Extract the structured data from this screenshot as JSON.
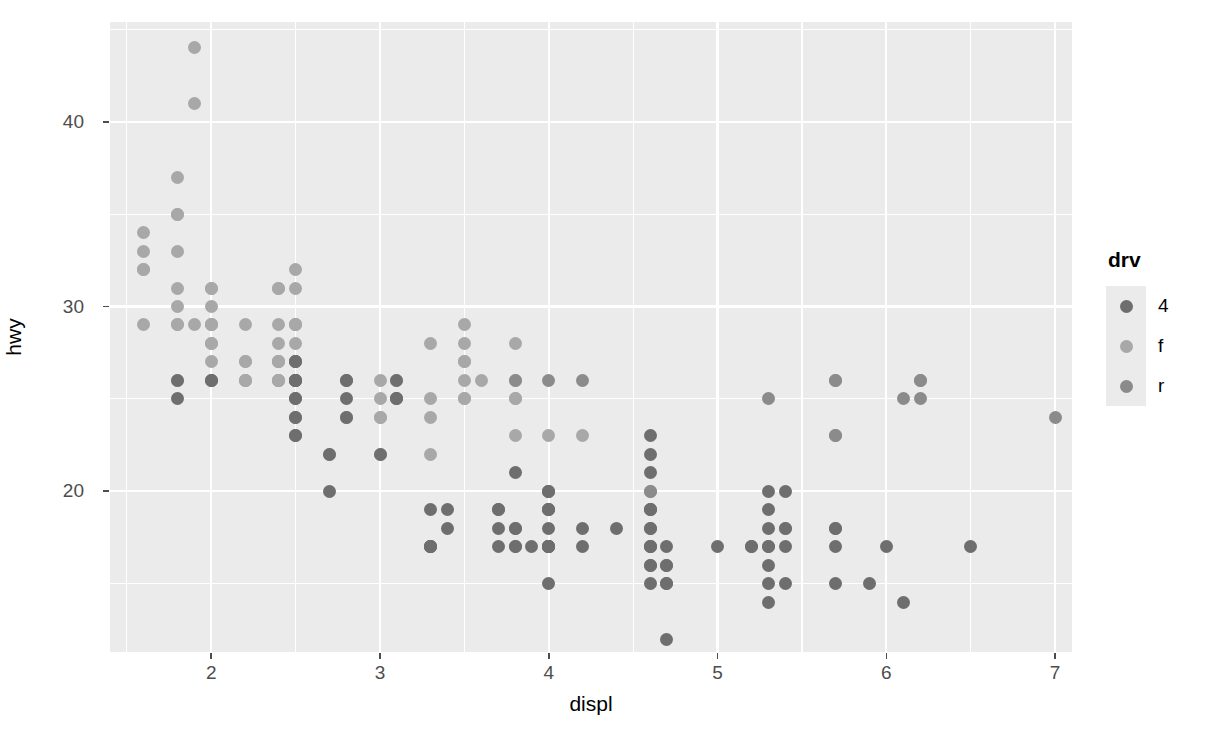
{
  "chart_data": {
    "type": "scatter",
    "title": "",
    "xlabel": "displ",
    "ylabel": "hwy",
    "xlim": [
      1.4,
      7.1
    ],
    "ylim": [
      11.3,
      45.4
    ],
    "xticks": [
      2,
      3,
      4,
      5,
      6,
      7
    ],
    "yticks": [
      20,
      30,
      40
    ],
    "xminor": [
      1.5,
      2.5,
      3.5,
      4.5,
      5.5,
      6.5
    ],
    "yminor": [
      15,
      25,
      35,
      45
    ],
    "grid": true,
    "legend": {
      "title": "drv",
      "position": "right",
      "entries": [
        {
          "label": "4",
          "color": "#6e6e6e"
        },
        {
          "label": "f",
          "color": "#a8a8a8"
        },
        {
          "label": "r",
          "color": "#8b8b8b"
        }
      ]
    },
    "panel_background": "#ebebeb",
    "grid_color": "#ffffff",
    "series": [
      {
        "name": "4",
        "color": "#6e6e6e",
        "points": [
          [
            1.8,
            26
          ],
          [
            1.8,
            25
          ],
          [
            2.0,
            26
          ],
          [
            2.0,
            26
          ],
          [
            2.8,
            26
          ],
          [
            2.8,
            26
          ],
          [
            2.8,
            25
          ],
          [
            2.8,
            24
          ],
          [
            3.1,
            25
          ],
          [
            3.1,
            26
          ],
          [
            3.1,
            25
          ],
          [
            2.5,
            23
          ],
          [
            2.5,
            24
          ],
          [
            2.5,
            24
          ],
          [
            2.5,
            23
          ],
          [
            2.5,
            25
          ],
          [
            2.5,
            26
          ],
          [
            2.5,
            25
          ],
          [
            2.5,
            26
          ],
          [
            2.5,
            26
          ],
          [
            2.5,
            26
          ],
          [
            2.5,
            27
          ],
          [
            2.5,
            27
          ],
          [
            3.3,
            17
          ],
          [
            3.3,
            17
          ],
          [
            3.3,
            17
          ],
          [
            3.3,
            19
          ],
          [
            3.3,
            17
          ],
          [
            3.7,
            17
          ],
          [
            3.7,
            18
          ],
          [
            3.7,
            19
          ],
          [
            3.7,
            19
          ],
          [
            3.8,
            17
          ],
          [
            3.8,
            17
          ],
          [
            3.8,
            18
          ],
          [
            3.8,
            18
          ],
          [
            3.8,
            21
          ],
          [
            4.0,
            17
          ],
          [
            4.0,
            20
          ],
          [
            4.0,
            19
          ],
          [
            4.0,
            18
          ],
          [
            4.0,
            15
          ],
          [
            4.0,
            17
          ],
          [
            4.0,
            17
          ],
          [
            4.0,
            17
          ],
          [
            4.0,
            17
          ],
          [
            4.0,
            19
          ],
          [
            4.0,
            20
          ],
          [
            4.2,
            18
          ],
          [
            4.6,
            19
          ],
          [
            4.6,
            19
          ],
          [
            4.6,
            17
          ],
          [
            4.6,
            17
          ],
          [
            4.6,
            17
          ],
          [
            4.6,
            16
          ],
          [
            4.6,
            16
          ],
          [
            4.6,
            15
          ],
          [
            4.6,
            21
          ],
          [
            4.6,
            22
          ],
          [
            4.6,
            23
          ],
          [
            4.7,
            12
          ],
          [
            4.7,
            16
          ],
          [
            4.7,
            15
          ],
          [
            4.7,
            16
          ],
          [
            4.7,
            15
          ],
          [
            5.2,
            17
          ],
          [
            5.2,
            17
          ],
          [
            5.3,
            20
          ],
          [
            5.3,
            19
          ],
          [
            5.3,
            18
          ],
          [
            5.3,
            17
          ],
          [
            5.3,
            16
          ],
          [
            5.3,
            15
          ],
          [
            5.3,
            14
          ],
          [
            5.4,
            20
          ],
          [
            5.4,
            18
          ],
          [
            5.4,
            17
          ],
          [
            5.4,
            15
          ],
          [
            5.7,
            18
          ],
          [
            5.7,
            18
          ],
          [
            5.7,
            17
          ],
          [
            5.7,
            15
          ],
          [
            5.9,
            15
          ],
          [
            6.0,
            17
          ],
          [
            6.1,
            14
          ],
          [
            6.5,
            17
          ],
          [
            4.0,
            19
          ],
          [
            4.0,
            17
          ],
          [
            3.9,
            17
          ],
          [
            4.2,
            17
          ],
          [
            4.4,
            18
          ],
          [
            2.7,
            20
          ],
          [
            2.7,
            22
          ],
          [
            3.0,
            22
          ],
          [
            3.4,
            19
          ],
          [
            3.4,
            18
          ],
          [
            5.0,
            17
          ],
          [
            5.3,
            17
          ],
          [
            4.7,
            17
          ],
          [
            4.6,
            18
          ],
          [
            4.6,
            18
          ]
        ]
      },
      {
        "name": "f",
        "color": "#a8a8a8",
        "points": [
          [
            1.6,
            33
          ],
          [
            1.6,
            32
          ],
          [
            1.6,
            29
          ],
          [
            1.6,
            32
          ],
          [
            1.6,
            34
          ],
          [
            1.8,
            29
          ],
          [
            1.8,
            29
          ],
          [
            1.8,
            31
          ],
          [
            1.8,
            30
          ],
          [
            1.8,
            33
          ],
          [
            1.8,
            35
          ],
          [
            1.8,
            37
          ],
          [
            1.8,
            35
          ],
          [
            1.9,
            44
          ],
          [
            1.9,
            41
          ],
          [
            1.9,
            29
          ],
          [
            2.0,
            28
          ],
          [
            2.0,
            29
          ],
          [
            2.0,
            31
          ],
          [
            2.0,
            28
          ],
          [
            2.0,
            30
          ],
          [
            2.0,
            26
          ],
          [
            2.0,
            27
          ],
          [
            2.0,
            29
          ],
          [
            2.0,
            31
          ],
          [
            2.2,
            26
          ],
          [
            2.2,
            27
          ],
          [
            2.2,
            26
          ],
          [
            2.2,
            29
          ],
          [
            2.2,
            27
          ],
          [
            2.4,
            26
          ],
          [
            2.4,
            27
          ],
          [
            2.4,
            26
          ],
          [
            2.4,
            31
          ],
          [
            2.4,
            29
          ],
          [
            2.4,
            27
          ],
          [
            2.4,
            31
          ],
          [
            2.4,
            26
          ],
          [
            2.4,
            28
          ],
          [
            2.5,
            27
          ],
          [
            2.5,
            29
          ],
          [
            2.5,
            32
          ],
          [
            2.5,
            31
          ],
          [
            2.5,
            29
          ],
          [
            2.5,
            27
          ],
          [
            2.5,
            28
          ],
          [
            2.8,
            24
          ],
          [
            2.8,
            24
          ],
          [
            3.0,
            24
          ],
          [
            3.0,
            25
          ],
          [
            3.0,
            26
          ],
          [
            3.1,
            25
          ],
          [
            3.1,
            26
          ],
          [
            3.3,
            24
          ],
          [
            3.3,
            22
          ],
          [
            3.3,
            28
          ],
          [
            3.5,
            25
          ],
          [
            3.5,
            29
          ],
          [
            3.5,
            27
          ],
          [
            3.5,
            28
          ],
          [
            3.5,
            27
          ],
          [
            3.6,
            26
          ],
          [
            3.8,
            28
          ],
          [
            3.8,
            26
          ],
          [
            3.8,
            25
          ],
          [
            3.8,
            23
          ],
          [
            4.0,
            23
          ],
          [
            4.2,
            23
          ],
          [
            2.7,
            22
          ],
          [
            3.0,
            22
          ],
          [
            3.0,
            24
          ],
          [
            2.4,
            26
          ],
          [
            2.4,
            27
          ],
          [
            2.5,
            26
          ],
          [
            1.8,
            26
          ],
          [
            2.0,
            29
          ],
          [
            2.2,
            26
          ],
          [
            2.5,
            29
          ],
          [
            3.5,
            26
          ],
          [
            3.8,
            25
          ],
          [
            2.4,
            27
          ],
          [
            3.3,
            25
          ],
          [
            3.5,
            25
          ],
          [
            2.5,
            26
          ]
        ]
      },
      {
        "name": "r",
        "color": "#8b8b8b",
        "points": [
          [
            4.0,
            20
          ],
          [
            4.6,
            19
          ],
          [
            4.6,
            20
          ],
          [
            5.7,
            26
          ],
          [
            5.7,
            23
          ],
          [
            6.2,
            26
          ],
          [
            6.2,
            25
          ],
          [
            7.0,
            24
          ],
          [
            5.3,
            25
          ],
          [
            4.6,
            20
          ],
          [
            5.4,
            18
          ],
          [
            3.8,
            26
          ],
          [
            4.0,
            26
          ],
          [
            4.2,
            26
          ],
          [
            5.7,
            23
          ],
          [
            5.7,
            26
          ],
          [
            6.1,
            25
          ],
          [
            6.2,
            26
          ]
        ]
      }
    ]
  }
}
